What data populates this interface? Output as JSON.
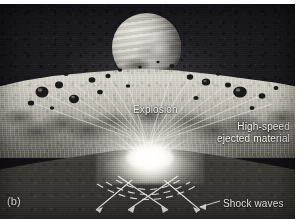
{
  "figure": {
    "panel_label": "(b)",
    "type": "astronomical-illustration",
    "palette": {
      "sky": "#1d1d21",
      "surface_highlight": "#d9d5cd",
      "foreground": "#3b3934",
      "flash": "#ffffff",
      "label_text": "#f2f1ee"
    }
  },
  "labels": {
    "explosion": "Explosion",
    "ejecta_line1": "High-speed",
    "ejecta_line2": "ejected material",
    "shock_waves": "Shock waves"
  },
  "elements": {
    "planet_name": "planet",
    "flash_name": "impact-flash",
    "surface_name": "moon-surface",
    "foreground_name": "foreground-terrain"
  }
}
